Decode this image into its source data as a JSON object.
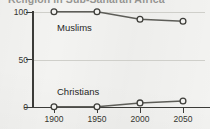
{
  "chart_data": {
    "type": "line",
    "title": "Religion in Sub-Saharan Africa",
    "xlabel": "",
    "ylabel": "",
    "x": [
      1900,
      1950,
      2000,
      2050
    ],
    "categories": [
      "1900",
      "1950",
      "2000",
      "2050"
    ],
    "series": [
      {
        "name": "Muslims",
        "values": [
          100,
          100,
          92,
          90
        ]
      },
      {
        "name": "Christians",
        "values": [
          0,
          0,
          4,
          6
        ]
      }
    ],
    "ylim": [
      0,
      100
    ],
    "yticks": [
      0,
      50,
      100
    ],
    "ytick_labels": [
      "0",
      "50",
      "100"
    ],
    "xlim": [
      1875,
      2075
    ],
    "grid": true,
    "legend_position": "inline-labels",
    "annotations": [
      {
        "text": "Muslims",
        "x": 1930,
        "y": 84
      },
      {
        "text": "Christians",
        "x": 1930,
        "y": 16
      }
    ],
    "colors": {
      "line": "#5d5d58",
      "marker_fill": "#f2f2f0",
      "marker_stroke": "#3e3e3a",
      "axis": "#3b3b38",
      "grid": "#cfcfca",
      "background": "#f2f2f0",
      "text": "#35352f"
    }
  }
}
